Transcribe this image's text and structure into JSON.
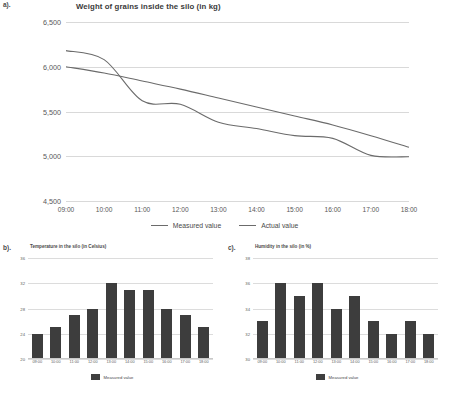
{
  "chart_data": [
    {
      "id": "a",
      "type": "line",
      "pane_label": "a).",
      "title": "Weight of grains inside the silo (in kg)",
      "xlabel": "",
      "ylabel": "",
      "ylim": [
        4500,
        6500
      ],
      "yticks": [
        4500,
        5000,
        5500,
        6000,
        6500
      ],
      "ytick_labels": [
        "4,500",
        "5,000",
        "5,500",
        "6,000",
        "6,500"
      ],
      "x": [
        "09:00",
        "10:00",
        "11:00",
        "12:00",
        "13:00",
        "14:00",
        "15:00",
        "16:00",
        "17:00",
        "18:00"
      ],
      "grid": true,
      "legend_position": "bottom",
      "series": [
        {
          "name": "Measured value",
          "color": "#6b6b6b",
          "values": [
            6180,
            6080,
            5620,
            5580,
            5380,
            5310,
            5230,
            5200,
            5010,
            4995
          ]
        },
        {
          "name": "Actual value",
          "color": "#6b6b6b",
          "values": [
            6000,
            5930,
            5840,
            5750,
            5650,
            5550,
            5450,
            5350,
            5230,
            5100
          ]
        }
      ]
    },
    {
      "id": "b",
      "type": "bar",
      "pane_label": "b).",
      "title": "Temperature in the silo (in Celsius)",
      "xlabel": "",
      "ylabel": "",
      "ylim": [
        20,
        36
      ],
      "yticks": [
        20,
        24,
        28,
        32,
        36
      ],
      "ytick_labels": [
        "20",
        "24",
        "28",
        "32",
        "36"
      ],
      "categories": [
        "09:00",
        "10:00",
        "11:00",
        "12:00",
        "13:00",
        "14:00",
        "15:00",
        "16:00",
        "17:00",
        "18:00"
      ],
      "values": [
        24,
        25,
        27,
        28,
        32,
        31,
        31,
        28,
        27,
        25
      ],
      "bar_color": "#3d3d3d",
      "grid": true,
      "legend_position": "bottom",
      "series_name": "Measured value"
    },
    {
      "id": "c",
      "type": "bar",
      "pane_label": "c).",
      "title": "Humidity in the silo (in %)",
      "xlabel": "",
      "ylabel": "",
      "ylim": [
        30,
        38
      ],
      "yticks": [
        30,
        32,
        34,
        36,
        38
      ],
      "ytick_labels": [
        "30",
        "32",
        "34",
        "36",
        "38"
      ],
      "categories": [
        "09:00",
        "10:00",
        "11:00",
        "12:00",
        "13:00",
        "14:00",
        "15:00",
        "16:00",
        "17:00",
        "18:00"
      ],
      "values": [
        33,
        36,
        35,
        36,
        34,
        35,
        33,
        32,
        33,
        32
      ],
      "bar_color": "#3d3d3d",
      "grid": true,
      "legend_position": "bottom",
      "series_name": "Measured value"
    }
  ]
}
